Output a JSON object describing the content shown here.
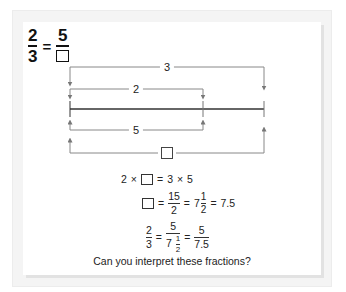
{
  "title_equation": {
    "left": {
      "numerator": "2",
      "denominator": "3"
    },
    "equals": "=",
    "right": {
      "numerator": "5",
      "denominator": "unknown-box"
    }
  },
  "diagram": {
    "labels": {
      "top_outer": "3",
      "top_inner": "2",
      "bottom_inner": "5",
      "bottom_outer": "unknown-box"
    },
    "colors": {
      "line": "#333333",
      "arrow": "#777777",
      "bracket": "#888888"
    }
  },
  "equations": [
    {
      "id": "eq1",
      "parts": [
        "2",
        "×",
        "□",
        "=",
        "3",
        "×",
        "5"
      ]
    },
    {
      "id": "eq2",
      "box": "□",
      "eq": "=",
      "frac_num": "15",
      "frac_den": "2",
      "eq2": "=",
      "mixed_whole": "7",
      "mixed_num": "1",
      "mixed_den": "2",
      "eq3": "=",
      "decimal": "7.5"
    },
    {
      "id": "eq3",
      "f1_num": "2",
      "f1_den": "3",
      "eq": "=",
      "f2_num": "5",
      "f2_den_whole": "7",
      "f2_den_num": "1",
      "f2_den_den": "2",
      "eq2": "=",
      "f3_num": "5",
      "f3_den": "7.5"
    }
  ],
  "caption": "Can you interpret these fractions?"
}
